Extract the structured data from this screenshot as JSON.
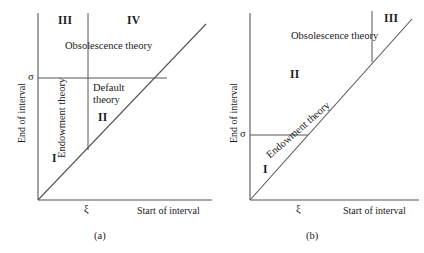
{
  "figure": {
    "axis_labels": {
      "x": "Start of interval",
      "y": "End of interval"
    },
    "ticks": {
      "x": "ξ",
      "y": "σ"
    },
    "line_color": "#555555",
    "text_color": "#1a1a1a",
    "background": "#ffffff"
  },
  "panels": [
    {
      "caption": "(a)",
      "regions": [
        {
          "id": "I",
          "label": "I"
        },
        {
          "id": "II",
          "label": "II"
        },
        {
          "id": "III",
          "label": "III"
        },
        {
          "id": "IV",
          "label": "IV"
        }
      ],
      "theories": {
        "obsolescence": "Obsolescence theory",
        "endowment": "Endowment theory",
        "default_line1": "Default",
        "default_line2": "theory"
      }
    },
    {
      "caption": "(b)",
      "regions": [
        {
          "id": "I",
          "label": "I"
        },
        {
          "id": "II",
          "label": "II"
        },
        {
          "id": "III",
          "label": "III"
        }
      ],
      "theories": {
        "obsolescence": "Obsolescence theory",
        "endowment": "Endowment theory"
      }
    }
  ]
}
